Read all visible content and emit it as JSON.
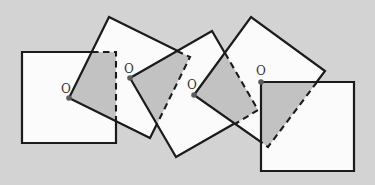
{
  "figure": {
    "canvas": {
      "width": 375,
      "height": 185,
      "background": "#d3d3d3"
    },
    "style": {
      "square_fill": "#fbfbfb",
      "shade_fill": "#c2c2c2",
      "stroke_color": "#1b1b1b",
      "stroke_width": 2.2,
      "dash_width": 2.1,
      "dash_pattern": "6.5 4.5",
      "dot_color": "#5c5c5c",
      "dot_radius": 2.8,
      "label_color": "#343434",
      "label_font_size": 12
    },
    "squares": [
      {
        "id": "A",
        "points": [
          [
            22,
            52
          ],
          [
            116,
            52
          ],
          [
            116,
            143
          ],
          [
            22,
            143
          ]
        ]
      },
      {
        "id": "B",
        "points": [
          [
            69,
            98
          ],
          [
            109,
            17
          ],
          [
            190,
            57
          ],
          [
            150,
            138
          ]
        ]
      },
      {
        "id": "C",
        "points": [
          [
            130,
            78
          ],
          [
            212,
            31
          ],
          [
            258,
            110
          ],
          [
            176,
            157
          ]
        ]
      },
      {
        "id": "D",
        "points": [
          [
            194,
            95
          ],
          [
            251,
            17
          ],
          [
            325,
            71
          ],
          [
            268,
            147
          ]
        ]
      },
      {
        "id": "E",
        "points": [
          [
            261,
            82
          ],
          [
            354,
            82
          ],
          [
            354,
            171
          ],
          [
            261,
            171
          ]
        ]
      }
    ],
    "shaded_overlaps": [
      {
        "between": "A-B",
        "points": [
          [
            69,
            98
          ],
          [
            92,
            52
          ],
          [
            116,
            52
          ],
          [
            116,
            121
          ]
        ]
      },
      {
        "between": "B-C",
        "points": [
          [
            130,
            78
          ],
          [
            177,
            51
          ],
          [
            190,
            57
          ],
          [
            157,
            124
          ]
        ]
      },
      {
        "between": "C-D",
        "points": [
          [
            194,
            95
          ],
          [
            225,
            53
          ],
          [
            258,
            110
          ],
          [
            235,
            124
          ]
        ]
      },
      {
        "between": "D-E",
        "points": [
          [
            261,
            82
          ],
          [
            317,
            82
          ],
          [
            268,
            147
          ],
          [
            261,
            142
          ]
        ]
      }
    ],
    "dashed_hidden_edges": [
      {
        "between": "A-B",
        "points": [
          [
            92,
            52
          ],
          [
            116,
            52
          ],
          [
            116,
            121
          ]
        ]
      },
      {
        "between": "B-C",
        "points": [
          [
            177,
            51
          ],
          [
            190,
            57
          ],
          [
            157,
            124
          ]
        ]
      },
      {
        "between": "C-D",
        "points": [
          [
            225,
            53
          ],
          [
            258,
            110
          ],
          [
            235,
            124
          ]
        ]
      },
      {
        "between": "D-E",
        "points": [
          [
            317,
            82
          ],
          [
            268,
            147
          ],
          [
            261,
            142
          ]
        ]
      }
    ],
    "rotation_centers": [
      {
        "label": "O",
        "dot": [
          69,
          98
        ],
        "label_pos": [
          66,
          93
        ]
      },
      {
        "label": "O",
        "dot": [
          130,
          78
        ],
        "label_pos": [
          129,
          73
        ]
      },
      {
        "label": "O",
        "dot": [
          194,
          95
        ],
        "label_pos": [
          192,
          89
        ]
      },
      {
        "label": "O",
        "dot": [
          261,
          82
        ],
        "label_pos": [
          261,
          75
        ]
      }
    ]
  }
}
